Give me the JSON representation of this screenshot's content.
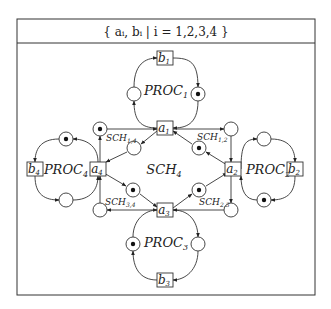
{
  "header": {
    "formula": "{ aᵢ, bᵢ | i = 1,2,3,4 }"
  },
  "center_label": "SCH",
  "center_label_sub": "4",
  "processes": [
    {
      "label": "PROC",
      "sub": "1"
    },
    {
      "label": "PROC",
      "sub": "2"
    },
    {
      "label": "PROC",
      "sub": "3"
    },
    {
      "label": "PROC",
      "sub": "4"
    }
  ],
  "transitions": {
    "a1": {
      "label": "a",
      "sub": "1"
    },
    "a2": {
      "label": "a",
      "sub": "2"
    },
    "a3": {
      "label": "a",
      "sub": "3"
    },
    "a4": {
      "label": "a",
      "sub": "4"
    },
    "b1": {
      "label": "b",
      "sub": "1"
    },
    "b2": {
      "label": "b",
      "sub": "2"
    },
    "b3": {
      "label": "b",
      "sub": "3"
    },
    "b4": {
      "label": "b",
      "sub": "4"
    }
  },
  "schedulers": [
    {
      "label": "SCH",
      "sub": "1,4"
    },
    {
      "label": "SCH",
      "sub": "1,2"
    },
    {
      "label": "SCH",
      "sub": "2,3"
    },
    {
      "label": "SCH",
      "sub": "3,4"
    }
  ],
  "places": [
    {
      "id": "p1-left",
      "marked": false
    },
    {
      "id": "p1-right",
      "marked": true
    },
    {
      "id": "p2-top",
      "marked": false
    },
    {
      "id": "p2-bottom",
      "marked": true
    },
    {
      "id": "p3-left",
      "marked": true
    },
    {
      "id": "p3-right",
      "marked": false
    },
    {
      "id": "p4-top",
      "marked": true
    },
    {
      "id": "p4-bottom",
      "marked": false
    },
    {
      "id": "s14-outer",
      "marked": true
    },
    {
      "id": "s14-inner",
      "marked": false
    },
    {
      "id": "s12-outer",
      "marked": false
    },
    {
      "id": "s12-inner",
      "marked": true
    },
    {
      "id": "s23-outer",
      "marked": false
    },
    {
      "id": "s23-inner",
      "marked": true
    },
    {
      "id": "s34-outer",
      "marked": false
    },
    {
      "id": "s34-inner",
      "marked": true
    }
  ]
}
